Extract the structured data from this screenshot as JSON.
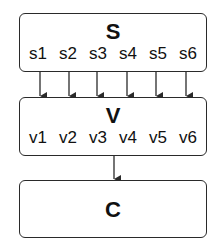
{
  "diagram": {
    "boxes": [
      {
        "id": "S",
        "title": "S",
        "items": [
          "s1",
          "s2",
          "s3",
          "s4",
          "s5",
          "s6"
        ]
      },
      {
        "id": "V",
        "title": "V",
        "items": [
          "v1",
          "v2",
          "v3",
          "v4",
          "v5",
          "v6"
        ]
      },
      {
        "id": "C",
        "title": "C",
        "items": []
      }
    ],
    "edges": [
      {
        "from": "s1",
        "to": "V"
      },
      {
        "from": "s2",
        "to": "V"
      },
      {
        "from": "s3",
        "to": "V"
      },
      {
        "from": "s4",
        "to": "V"
      },
      {
        "from": "s5",
        "to": "V"
      },
      {
        "from": "s6",
        "to": "V"
      },
      {
        "from": "V",
        "to": "C"
      }
    ],
    "colors": {
      "stroke": "#2a2a2a",
      "text": "#111111",
      "background": "#ffffff"
    }
  }
}
